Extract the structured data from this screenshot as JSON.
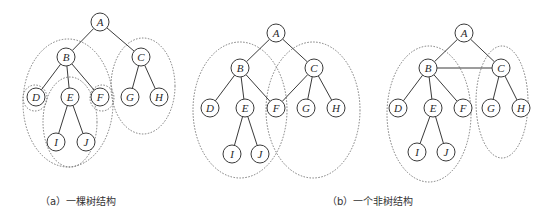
{
  "figures": [
    {
      "id": "a",
      "caption": "（a）一棵树结构",
      "caption_pos": {
        "x": 40,
        "y": 193
      },
      "nodes": [
        {
          "id": "A",
          "label": "A",
          "x": 100,
          "y": 22
        },
        {
          "id": "B",
          "label": "B",
          "x": 66,
          "y": 57
        },
        {
          "id": "C",
          "label": "C",
          "x": 141,
          "y": 57
        },
        {
          "id": "D",
          "label": "D",
          "x": 36,
          "y": 97
        },
        {
          "id": "E",
          "label": "E",
          "x": 70,
          "y": 97
        },
        {
          "id": "F",
          "label": "F",
          "x": 100,
          "y": 97
        },
        {
          "id": "G",
          "label": "G",
          "x": 130,
          "y": 97
        },
        {
          "id": "H",
          "label": "H",
          "x": 159,
          "y": 97
        },
        {
          "id": "I",
          "label": "I",
          "x": 56,
          "y": 142
        },
        {
          "id": "J",
          "label": "J",
          "x": 86,
          "y": 142
        }
      ],
      "edges": [
        [
          "A",
          "B"
        ],
        [
          "A",
          "C"
        ],
        [
          "B",
          "D"
        ],
        [
          "B",
          "E"
        ],
        [
          "B",
          "F"
        ],
        [
          "C",
          "G"
        ],
        [
          "C",
          "H"
        ],
        [
          "E",
          "I"
        ],
        [
          "E",
          "J"
        ]
      ],
      "groups": [
        {
          "name": "subtree-B",
          "cx": 68,
          "cy": 103,
          "rx": 45,
          "ry": 64
        },
        {
          "name": "subtree-C",
          "cx": 143,
          "cy": 86,
          "rx": 32,
          "ry": 48
        },
        {
          "name": "subtree-D",
          "cx": 35,
          "cy": 98,
          "rx": 12,
          "ry": 13
        },
        {
          "name": "subtree-E",
          "cx": 70,
          "cy": 122,
          "rx": 27,
          "ry": 45
        },
        {
          "name": "subtree-F",
          "cx": 102,
          "cy": 98,
          "rx": 12,
          "ry": 13
        }
      ]
    },
    {
      "id": "b",
      "caption": "（b）一个非树结构",
      "caption_pos": {
        "x": 327,
        "y": 193
      },
      "nodes": [
        {
          "id": "A",
          "label": "A",
          "x": 276,
          "y": 33
        },
        {
          "id": "B",
          "label": "B",
          "x": 240,
          "y": 68
        },
        {
          "id": "C",
          "label": "C",
          "x": 314,
          "y": 68
        },
        {
          "id": "D",
          "label": "D",
          "x": 210,
          "y": 108
        },
        {
          "id": "E",
          "label": "E",
          "x": 245,
          "y": 108
        },
        {
          "id": "F",
          "label": "F",
          "x": 276,
          "y": 108
        },
        {
          "id": "G",
          "label": "G",
          "x": 306,
          "y": 108
        },
        {
          "id": "H",
          "label": "H",
          "x": 336,
          "y": 108
        },
        {
          "id": "I",
          "label": "I",
          "x": 232,
          "y": 154
        },
        {
          "id": "J",
          "label": "J",
          "x": 260,
          "y": 154
        }
      ],
      "edges": [
        [
          "A",
          "B"
        ],
        [
          "A",
          "C"
        ],
        [
          "B",
          "D"
        ],
        [
          "B",
          "E"
        ],
        [
          "B",
          "F"
        ],
        [
          "C",
          "F"
        ],
        [
          "C",
          "G"
        ],
        [
          "C",
          "H"
        ],
        [
          "E",
          "I"
        ],
        [
          "E",
          "J"
        ]
      ],
      "groups": [
        {
          "name": "subtree-B",
          "cx": 240,
          "cy": 110,
          "rx": 47,
          "ry": 68
        },
        {
          "name": "subtree-C",
          "cx": 313,
          "cy": 110,
          "rx": 47,
          "ry": 68
        }
      ]
    },
    {
      "id": "c",
      "caption": "",
      "nodes": [
        {
          "id": "A",
          "label": "A",
          "x": 464,
          "y": 33
        },
        {
          "id": "B",
          "label": "B",
          "x": 428,
          "y": 68
        },
        {
          "id": "C",
          "label": "C",
          "x": 501,
          "y": 68
        },
        {
          "id": "D",
          "label": "D",
          "x": 398,
          "y": 108
        },
        {
          "id": "E",
          "label": "E",
          "x": 433,
          "y": 108
        },
        {
          "id": "F",
          "label": "F",
          "x": 463,
          "y": 108
        },
        {
          "id": "G",
          "label": "G",
          "x": 491,
          "y": 108
        },
        {
          "id": "H",
          "label": "H",
          "x": 521,
          "y": 108
        },
        {
          "id": "I",
          "label": "I",
          "x": 417,
          "y": 152
        },
        {
          "id": "J",
          "label": "J",
          "x": 446,
          "y": 152
        }
      ],
      "edges": [
        [
          "A",
          "B"
        ],
        [
          "A",
          "C"
        ],
        [
          "B",
          "C"
        ],
        [
          "B",
          "D"
        ],
        [
          "B",
          "E"
        ],
        [
          "B",
          "F"
        ],
        [
          "C",
          "G"
        ],
        [
          "C",
          "H"
        ],
        [
          "E",
          "I"
        ],
        [
          "E",
          "J"
        ]
      ],
      "groups": [
        {
          "name": "subtree-B",
          "cx": 429,
          "cy": 114,
          "rx": 42,
          "ry": 68
        },
        {
          "name": "subtree-C",
          "cx": 502,
          "cy": 102,
          "rx": 26,
          "ry": 56
        }
      ]
    }
  ],
  "style": {
    "node_radius": 9,
    "edge_color": "#3a3a3a",
    "group_color": "#7a7a7a"
  }
}
